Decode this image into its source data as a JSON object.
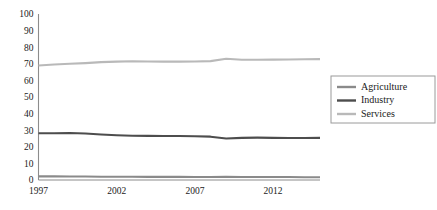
{
  "chart_data": {
    "type": "line",
    "title": "",
    "xlabel": "",
    "ylabel": "",
    "x": [
      1997,
      1998,
      1999,
      2000,
      2001,
      2002,
      2003,
      2004,
      2005,
      2006,
      2007,
      2008,
      2009,
      2010,
      2011,
      2012,
      2013,
      2014,
      2015
    ],
    "x_tick_labels": [
      "1997",
      "2002",
      "2007",
      "2012"
    ],
    "x_ticks": [
      1997,
      2002,
      2007,
      2012
    ],
    "y_tick_labels": [
      "0",
      "10",
      "20",
      "30",
      "40",
      "50",
      "60",
      "70",
      "80",
      "90",
      "100"
    ],
    "y_ticks": [
      0,
      10,
      20,
      30,
      40,
      50,
      60,
      70,
      80,
      90,
      100
    ],
    "ylim": [
      0,
      100
    ],
    "xlim": [
      1997,
      2015
    ],
    "grid": false,
    "legend_position": "right",
    "series": [
      {
        "name": "Agriculture",
        "color": "#8a8a8a",
        "values": [
          2.2,
          2.2,
          2.1,
          2.1,
          2.0,
          2.0,
          2.0,
          1.9,
          1.9,
          1.9,
          1.8,
          1.8,
          1.9,
          1.8,
          1.8,
          1.8,
          1.8,
          1.7,
          1.7
        ]
      },
      {
        "name": "Industry",
        "color": "#4d4d4d",
        "values": [
          28.2,
          28.2,
          28.3,
          28.0,
          27.4,
          27.0,
          26.7,
          26.6,
          26.5,
          26.5,
          26.4,
          26.1,
          25.0,
          25.4,
          25.5,
          25.4,
          25.3,
          25.3,
          25.4
        ]
      },
      {
        "name": "Services",
        "color": "#b9b9b9",
        "values": [
          69.0,
          69.6,
          70.0,
          70.4,
          71.0,
          71.3,
          71.5,
          71.4,
          71.3,
          71.3,
          71.4,
          71.6,
          73.0,
          72.4,
          72.4,
          72.5,
          72.6,
          72.7,
          72.8
        ]
      }
    ]
  },
  "legend": {
    "items": [
      {
        "label": "Agriculture"
      },
      {
        "label": "Industry"
      },
      {
        "label": "Services"
      }
    ]
  }
}
